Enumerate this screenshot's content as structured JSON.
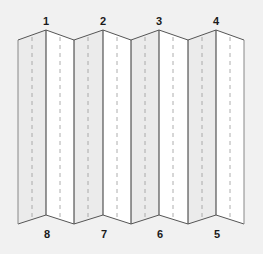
{
  "diagram": {
    "type": "accordion-fold-leaflet",
    "panel_count": 8,
    "top_labels": [
      "1",
      "2",
      "3",
      "4"
    ],
    "bottom_labels": [
      "8",
      "7",
      "6",
      "5"
    ],
    "colors": {
      "background": "#f1f1f1",
      "panel_shaded": "#ebebeb",
      "panel_light": "#ffffff",
      "outline": "#555555",
      "fold_line": "#333333",
      "dashed_line": "#9a9a9a",
      "label": "#1a1a1a"
    }
  }
}
